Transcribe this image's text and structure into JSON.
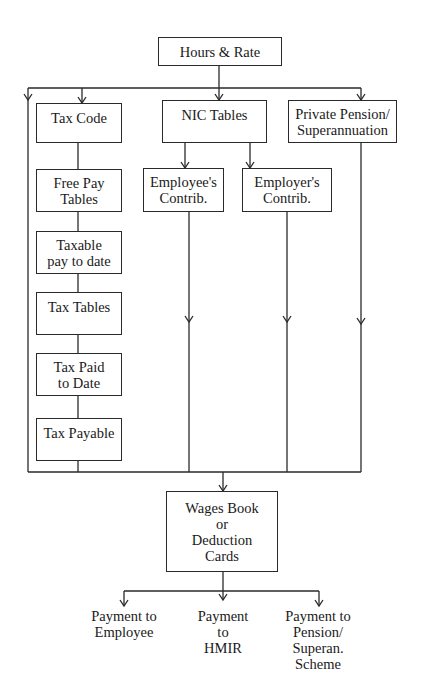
{
  "diagram": {
    "top": {
      "label": "Hours & Rate"
    },
    "tax_column": [
      {
        "lines": [
          "Tax Code"
        ]
      },
      {
        "lines": [
          "Free Pay",
          "Tables"
        ]
      },
      {
        "lines": [
          "Taxable",
          "pay to date"
        ]
      },
      {
        "lines": [
          "Tax Tables"
        ]
      },
      {
        "lines": [
          "Tax Paid",
          "to Date"
        ]
      },
      {
        "lines": [
          "Tax Payable"
        ]
      }
    ],
    "nic": {
      "label": "NIC Tables",
      "employee": {
        "lines": [
          "Employee's",
          "Contrib."
        ]
      },
      "employer": {
        "lines": [
          "Employer's",
          "Contrib."
        ]
      }
    },
    "pension": {
      "lines": [
        "Private Pension/",
        "Superannuation"
      ]
    },
    "wages": {
      "lines": [
        "Wages Book",
        "or",
        "Deduction",
        "Cards"
      ]
    },
    "outputs": [
      {
        "lines": [
          "Payment to",
          "Employee"
        ]
      },
      {
        "lines": [
          "Payment",
          "to",
          "HMIR"
        ]
      },
      {
        "lines": [
          "Payment to",
          "Pension/",
          "Superan.",
          "Scheme"
        ]
      }
    ],
    "colors": {
      "line": "#2a2a2a",
      "background": "#ffffff",
      "text": "#1a1a1a"
    }
  }
}
